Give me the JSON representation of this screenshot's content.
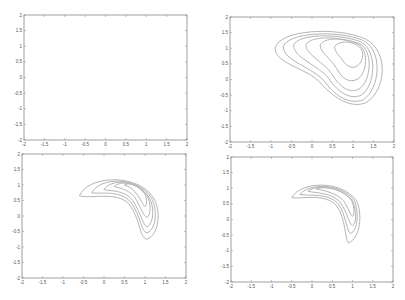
{
  "chart_data": [
    {
      "type": "contour",
      "panel": "top-left",
      "title": "",
      "xlabel": "",
      "ylabel": "",
      "xlim": [
        -2,
        2
      ],
      "ylim": [
        -2,
        2
      ],
      "xticks": [
        "-2",
        "-1.5",
        "-1",
        "-0.5",
        "0",
        "0.5",
        "1",
        "1.5",
        "2"
      ],
      "yticks": [
        "2",
        "1.5",
        "1",
        "0.5",
        "0",
        "-0.5",
        "-1",
        "-1.5",
        "-2"
      ],
      "grid": false,
      "description": "Broad diagonal contour bands sweeping from upper-left to lower-right, maximum toward upper-right corner",
      "contour_labels": [
        "0.016",
        "0.016",
        "0.16",
        "0.16",
        "1.6",
        "1.6",
        "16",
        "16"
      ]
    },
    {
      "type": "contour",
      "panel": "top-right",
      "xlim": [
        -2,
        2
      ],
      "ylim": [
        -2,
        2
      ],
      "xticks": [
        "-2",
        "-1.5",
        "-1",
        "-0.5",
        "0",
        "0.5",
        "1",
        "1.5",
        "2"
      ],
      "yticks": [
        "2",
        "1.5",
        "1",
        "0.5",
        "0",
        "-0.5",
        "-1",
        "-1.5",
        "-2"
      ],
      "grid": false,
      "description": "Nested closed contours forming an elongated kidney shape centered near (1, 0.9)",
      "contour_labels": [
        "0.016",
        "0.0016",
        "0.16",
        "1.6",
        "0.16",
        "0.016"
      ]
    },
    {
      "type": "contour",
      "panel": "bottom-left",
      "xlim": [
        -2,
        2
      ],
      "ylim": [
        -2,
        2
      ],
      "xticks": [
        "-2",
        "-1.5",
        "-1",
        "-0.5",
        "0",
        "0.5",
        "1",
        "1.5",
        "2"
      ],
      "yticks": [
        "2",
        "1.5",
        "1",
        "0.5",
        "0",
        "-0.5",
        "-1",
        "-1.5",
        "-2"
      ],
      "grid": false,
      "description": "Narrow banana-shaped contours arcing from (0, 1.1) to (1.1, -0.4)",
      "contour_labels": [
        "0.16",
        "0.016",
        "1.6",
        "0.16",
        "0.016"
      ]
    },
    {
      "type": "contour",
      "panel": "bottom-right",
      "xlim": [
        -2,
        2
      ],
      "ylim": [
        -2,
        2
      ],
      "xticks": [
        "-2",
        "-1.5",
        "-1",
        "-0.5",
        "0",
        "0.5",
        "1",
        "1.5",
        "2"
      ],
      "yticks": [
        "2",
        "1.5",
        "1",
        "0.5",
        "0",
        "-0.5",
        "-1",
        "-1.5",
        "-2"
      ],
      "grid": false,
      "description": "Very thin crescent contours arcing from (-0.2, 0.9) to (1.1, -0.3)",
      "contour_labels": [
        "0.016",
        "0.16",
        "0.16",
        "1.6",
        "0.016"
      ]
    }
  ],
  "colors": {
    "axis": "#888888",
    "contour": "#aaaaaa",
    "text": "#555555"
  }
}
